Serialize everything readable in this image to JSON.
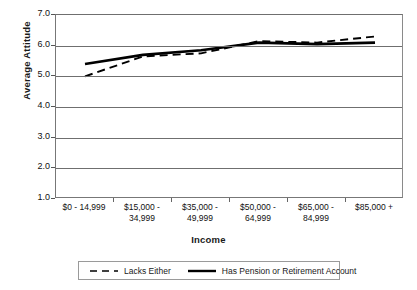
{
  "chart_data": {
    "type": "line",
    "title": "",
    "xlabel": "Income",
    "ylabel": "Average Attitude",
    "categories": [
      "$0 - 14,999",
      "$15,000 -\n34,999",
      "$35,000 -\n49,999",
      "$50,000 -\n64,999",
      "$65,000 -\n84,999",
      "$85,000 +"
    ],
    "ylim": [
      1.0,
      7.0
    ],
    "ytick_labels": [
      "7.0",
      "6.0",
      "5.0",
      "4.0",
      "3.0",
      "2.0",
      "1.0"
    ],
    "ytick_values": [
      7.0,
      6.0,
      5.0,
      4.0,
      3.0,
      2.0,
      1.0
    ],
    "grid": true,
    "legend_position": "bottom",
    "series": [
      {
        "name": "Lacks Either",
        "style": "dashed",
        "color": "#000000",
        "values": [
          5.0,
          5.65,
          5.75,
          6.15,
          6.1,
          6.3
        ]
      },
      {
        "name": "Has Pension or Retirement Account",
        "style": "solid",
        "color": "#000000",
        "values": [
          5.4,
          5.7,
          5.85,
          6.1,
          6.05,
          6.1
        ]
      }
    ]
  },
  "legend": {
    "items": [
      {
        "label": "Lacks Either",
        "style": "dashed"
      },
      {
        "label": "Has Pension or Retirement Account",
        "style": "solid"
      }
    ]
  }
}
